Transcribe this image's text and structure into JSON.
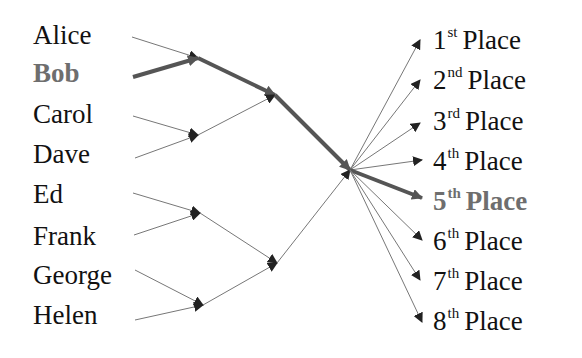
{
  "colors": {
    "text": "#111111",
    "highlight": "#6e6e6e",
    "thin_edge": "#777777",
    "thick_edge": "#555555",
    "arrowhead": "#222222",
    "background": "#ffffff"
  },
  "players": [
    {
      "name": "Alice",
      "highlight": false
    },
    {
      "name": "Bob",
      "highlight": true
    },
    {
      "name": "Carol",
      "highlight": false
    },
    {
      "name": "Dave",
      "highlight": false
    },
    {
      "name": "Ed",
      "highlight": false
    },
    {
      "name": "Frank",
      "highlight": false
    },
    {
      "name": "George",
      "highlight": false
    },
    {
      "name": "Helen",
      "highlight": false
    }
  ],
  "places": [
    {
      "num": "1",
      "suffix": "st",
      "word": "Place",
      "highlight": false
    },
    {
      "num": "2",
      "suffix": "nd",
      "word": "Place",
      "highlight": false
    },
    {
      "num": "3",
      "suffix": "rd",
      "word": "Place",
      "highlight": false
    },
    {
      "num": "4",
      "suffix": "th",
      "word": "Place",
      "highlight": false
    },
    {
      "num": "5",
      "suffix": "th",
      "word": "Place",
      "highlight": true
    },
    {
      "num": "6",
      "suffix": "th",
      "word": "Place",
      "highlight": false
    },
    {
      "num": "7",
      "suffix": "th",
      "word": "Place",
      "highlight": false
    },
    {
      "num": "8",
      "suffix": "th",
      "word": "Place",
      "highlight": false
    }
  ],
  "edges": [
    {
      "from": [
        132,
        37
      ],
      "to": [
        198,
        58
      ],
      "thick": false
    },
    {
      "from": [
        133,
        77
      ],
      "to": [
        198,
        58
      ],
      "thick": true
    },
    {
      "from": [
        133,
        116
      ],
      "to": [
        198,
        135
      ],
      "thick": false
    },
    {
      "from": [
        135,
        158
      ],
      "to": [
        198,
        135
      ],
      "thick": false
    },
    {
      "from": [
        133,
        193
      ],
      "to": [
        200,
        213
      ],
      "thick": false
    },
    {
      "from": [
        134,
        235
      ],
      "to": [
        200,
        213
      ],
      "thick": false
    },
    {
      "from": [
        135,
        270
      ],
      "to": [
        203,
        305
      ],
      "thick": false
    },
    {
      "from": [
        135,
        320
      ],
      "to": [
        203,
        305
      ],
      "thick": false
    },
    {
      "from": [
        198,
        58
      ],
      "to": [
        275,
        95
      ],
      "thick": true
    },
    {
      "from": [
        198,
        135
      ],
      "to": [
        275,
        95
      ],
      "thick": false
    },
    {
      "from": [
        200,
        213
      ],
      "to": [
        277,
        263
      ],
      "thick": false
    },
    {
      "from": [
        203,
        305
      ],
      "to": [
        277,
        263
      ],
      "thick": false
    },
    {
      "from": [
        275,
        95
      ],
      "to": [
        350,
        170
      ],
      "thick": true
    },
    {
      "from": [
        277,
        263
      ],
      "to": [
        350,
        170
      ],
      "thick": false
    },
    {
      "from": [
        350,
        170
      ],
      "to": [
        420,
        40
      ],
      "thick": false
    },
    {
      "from": [
        350,
        170
      ],
      "to": [
        420,
        80
      ],
      "thick": false
    },
    {
      "from": [
        350,
        170
      ],
      "to": [
        420,
        123
      ],
      "thick": false
    },
    {
      "from": [
        350,
        170
      ],
      "to": [
        422,
        160
      ],
      "thick": false
    },
    {
      "from": [
        350,
        170
      ],
      "to": [
        422,
        198
      ],
      "thick": true
    },
    {
      "from": [
        350,
        170
      ],
      "to": [
        422,
        240
      ],
      "thick": false
    },
    {
      "from": [
        350,
        170
      ],
      "to": [
        420,
        280
      ],
      "thick": false
    },
    {
      "from": [
        350,
        170
      ],
      "to": [
        422,
        322
      ],
      "thick": false
    }
  ]
}
